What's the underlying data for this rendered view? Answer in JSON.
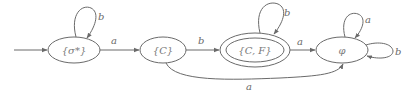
{
  "diagram": {
    "type": "finite-automaton",
    "colors": {
      "stroke": "#6a6a6a",
      "text": "#6a6a6a",
      "background": "#ffffff"
    },
    "nodes": [
      {
        "id": "n1",
        "label": "{σ*}",
        "start": true,
        "accepting": false
      },
      {
        "id": "n2",
        "label": "{C}",
        "start": false,
        "accepting": false
      },
      {
        "id": "n3",
        "label": "{C, F}",
        "start": false,
        "accepting": true
      },
      {
        "id": "n4",
        "label": "φ",
        "start": false,
        "accepting": false
      }
    ],
    "edges": [
      {
        "from": "n1",
        "to": "n1",
        "label": "b"
      },
      {
        "from": "n1",
        "to": "n2",
        "label": "a"
      },
      {
        "from": "n2",
        "to": "n3",
        "label": "b"
      },
      {
        "from": "n2",
        "to": "n4",
        "label": "a"
      },
      {
        "from": "n3",
        "to": "n3",
        "label": "b"
      },
      {
        "from": "n3",
        "to": "n4",
        "label": "a"
      },
      {
        "from": "n4",
        "to": "n4",
        "label": "a"
      },
      {
        "from": "n4",
        "to": "n4",
        "label": "b"
      }
    ]
  }
}
